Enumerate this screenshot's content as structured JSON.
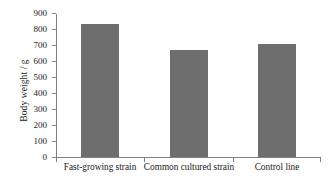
{
  "chart_data": {
    "type": "bar",
    "title": "",
    "xlabel": "",
    "ylabel": "Body weight / g",
    "categories": [
      "Fast-growing strain",
      "Common cultured strain",
      "Control line"
    ],
    "values": [
      840,
      675,
      712
    ],
    "ylim": [
      0,
      900
    ],
    "ytick_labels": [
      "0",
      "100",
      "200",
      "300",
      "400",
      "500",
      "600",
      "700",
      "800",
      "900"
    ],
    "ytick_values": [
      0,
      100,
      200,
      300,
      400,
      500,
      600,
      700,
      800,
      900
    ],
    "grid": false,
    "legend": "none",
    "bar_color": "#6e6e6e",
    "axis_color": "#808080",
    "text_color": "#1a1a1a"
  }
}
